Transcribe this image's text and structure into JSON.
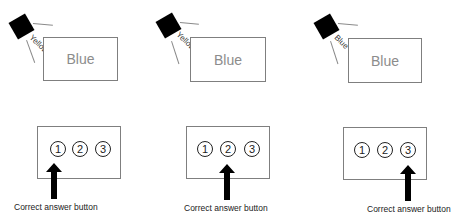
{
  "trials": [
    {
      "speaker_label": "Yellow",
      "stimulus_word": "Blue",
      "options": [
        "1",
        "2",
        "3"
      ],
      "correct_option_index": 0,
      "caption": "Correct answer button"
    },
    {
      "speaker_label": "Yellow",
      "stimulus_word": "Blue",
      "options": [
        "1",
        "2",
        "3"
      ],
      "correct_option_index": 1,
      "caption": "Correct answer button"
    },
    {
      "speaker_label": "Blue",
      "stimulus_word": "Blue",
      "options": [
        "1",
        "2",
        "3"
      ],
      "correct_option_index": 2,
      "caption": "Correct answer button"
    }
  ],
  "icons": {
    "speaker": "speaker-icon",
    "arrow": "arrow-up-icon"
  }
}
